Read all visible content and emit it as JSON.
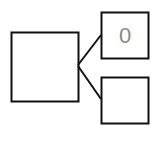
{
  "diagram": {
    "root_box": {
      "label": ""
    },
    "children": [
      {
        "label": "0"
      },
      {
        "label": ""
      }
    ],
    "colors": {
      "stroke": "#111111",
      "label": "#8a8a8a",
      "background": "#ffffff"
    }
  }
}
